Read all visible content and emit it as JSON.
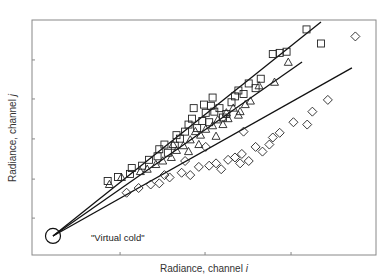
{
  "chart_data": {
    "type": "scatter",
    "title": "",
    "xlabel": "Radiance, channel i",
    "ylabel": "Radiance, channel j",
    "xlabel_parts": {
      "text": "Radiance, channel ",
      "var": "i"
    },
    "ylabel_parts": {
      "text": "Radiance, channel ",
      "var": "j"
    },
    "xlim": [
      0,
      100
    ],
    "ylim": [
      0,
      100
    ],
    "grid": false,
    "legend": null,
    "x_ticks": [
      25.6,
      50.3,
      75.3
    ],
    "y_ticks": [
      15.7,
      32.3,
      49.4,
      66.4,
      83.0
    ],
    "tick_labels_shown": false,
    "annotations": [
      {
        "text": "\"Virtual cold\"",
        "x": 17,
        "y": 8,
        "marker": "open-circle",
        "marker_x": 6.1,
        "marker_y": 8.1
      }
    ],
    "series": [
      {
        "name": "squares",
        "marker": "square",
        "fit_line": {
          "x0": 6.1,
          "y0": 8.1,
          "x1": 84.0,
          "y1": 99.1
        },
        "points": [
          [
            22.0,
            31.5
          ],
          [
            25.0,
            33.2
          ],
          [
            28.5,
            34.5
          ],
          [
            29.0,
            37.0
          ],
          [
            32.0,
            38.0
          ],
          [
            34.0,
            40.5
          ],
          [
            36.5,
            42.0
          ],
          [
            37.0,
            45.0
          ],
          [
            39.5,
            43.5
          ],
          [
            41.5,
            46.5
          ],
          [
            43.0,
            49.5
          ],
          [
            44.5,
            52.5
          ],
          [
            45.5,
            55.5
          ],
          [
            46.5,
            58.0
          ],
          [
            48.0,
            54.0
          ],
          [
            49.5,
            57.0
          ],
          [
            50.5,
            60.5
          ],
          [
            51.5,
            56.5
          ],
          [
            52.0,
            63.5
          ],
          [
            53.0,
            61.0
          ],
          [
            54.5,
            62.5
          ],
          [
            56.5,
            60.0
          ],
          [
            58.0,
            65.0
          ],
          [
            60.0,
            70.0
          ],
          [
            61.5,
            68.5
          ],
          [
            63.0,
            73.0
          ],
          [
            65.0,
            71.0
          ],
          [
            50.0,
            64.0
          ],
          [
            47.0,
            62.5
          ],
          [
            52.5,
            67.0
          ],
          [
            59.0,
            67.5
          ],
          [
            66.5,
            75.0
          ],
          [
            70.0,
            85.5
          ],
          [
            72.0,
            86.0
          ],
          [
            74.0,
            86.5
          ],
          [
            79.8,
            96.0
          ],
          [
            84.0,
            90.0
          ],
          [
            42.0,
            51.0
          ],
          [
            38.5,
            47.0
          ],
          [
            55.5,
            58.5
          ]
        ]
      },
      {
        "name": "triangles",
        "marker": "triangle",
        "fit_line": {
          "x0": 6.1,
          "y0": 8.1,
          "x1": 78.5,
          "y1": 82.1
        },
        "points": [
          [
            22.5,
            30.0
          ],
          [
            26.0,
            33.0
          ],
          [
            31.5,
            35.5
          ],
          [
            33.5,
            36.5
          ],
          [
            36.0,
            38.5
          ],
          [
            38.0,
            40.0
          ],
          [
            40.5,
            41.5
          ],
          [
            42.0,
            44.5
          ],
          [
            44.0,
            46.5
          ],
          [
            46.0,
            49.0
          ],
          [
            47.5,
            52.5
          ],
          [
            49.0,
            51.0
          ],
          [
            50.5,
            53.5
          ],
          [
            52.5,
            55.0
          ],
          [
            54.0,
            57.5
          ],
          [
            55.5,
            55.5
          ],
          [
            57.0,
            58.0
          ],
          [
            58.5,
            62.5
          ],
          [
            60.5,
            61.0
          ],
          [
            62.0,
            64.0
          ],
          [
            63.5,
            65.5
          ],
          [
            66.0,
            72.0
          ],
          [
            70.5,
            73.5
          ],
          [
            74.5,
            82.0
          ],
          [
            45.5,
            44.0
          ],
          [
            48.5,
            47.0
          ],
          [
            53.5,
            50.5
          ],
          [
            56.5,
            60.5
          ],
          [
            41.0,
            47.0
          ],
          [
            60.0,
            59.5
          ]
        ]
      },
      {
        "name": "diamonds",
        "marker": "diamond",
        "fit_line": {
          "x0": 6.1,
          "y0": 8.1,
          "x1": 93.0,
          "y1": 79.6
        },
        "points": [
          [
            27.5,
            26.5
          ],
          [
            31.0,
            28.5
          ],
          [
            34.5,
            30.0
          ],
          [
            37.0,
            30.5
          ],
          [
            40.0,
            33.0
          ],
          [
            43.5,
            35.0
          ],
          [
            46.0,
            34.0
          ],
          [
            48.5,
            37.5
          ],
          [
            51.5,
            38.0
          ],
          [
            53.5,
            39.0
          ],
          [
            55.0,
            36.5
          ],
          [
            57.0,
            40.5
          ],
          [
            59.0,
            41.5
          ],
          [
            61.0,
            43.0
          ],
          [
            63.0,
            40.0
          ],
          [
            65.0,
            46.0
          ],
          [
            67.0,
            44.0
          ],
          [
            69.0,
            47.0
          ],
          [
            72.0,
            52.0
          ],
          [
            76.0,
            56.5
          ],
          [
            81.5,
            61.0
          ],
          [
            86.0,
            66.0
          ],
          [
            94.0,
            93.0
          ],
          [
            80.0,
            55.5
          ],
          [
            61.5,
            52.5
          ],
          [
            50.5,
            46.0
          ],
          [
            44.5,
            40.0
          ],
          [
            70.0,
            50.0
          ],
          [
            60.5,
            39.0
          ],
          [
            38.5,
            34.0
          ]
        ]
      }
    ]
  }
}
